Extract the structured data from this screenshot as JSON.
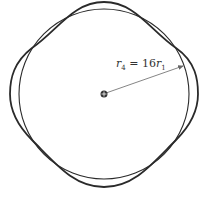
{
  "diagram": {
    "label": {
      "lhs": "r",
      "lhs_sub": "4",
      "eq": " = ",
      "coef": "16",
      "rhs": "r",
      "rhs_sub": "1"
    },
    "colors": {
      "stroke": "#2a2a2a",
      "arrow": "#666666"
    }
  }
}
